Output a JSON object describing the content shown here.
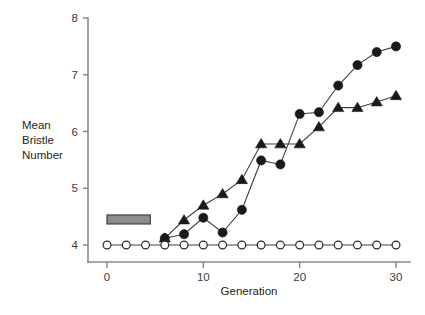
{
  "chart_data": {
    "type": "line",
    "title": "",
    "xlabel": "Generation",
    "ylabel": "Mean Bristle Number",
    "ylabel_lines": [
      "Mean",
      "Bristle",
      "Number"
    ],
    "xlim": [
      0,
      30
    ],
    "ylim": [
      4,
      8
    ],
    "xticks": [
      0,
      10,
      20,
      30
    ],
    "yticks": [
      4,
      5,
      6,
      7,
      8
    ],
    "xtick_labels": [
      "0",
      "10",
      "20",
      "30"
    ],
    "ytick_labels": [
      "4",
      "5",
      "6",
      "7",
      "8"
    ],
    "grid": false,
    "legend": "none",
    "x": [
      0,
      2,
      4,
      6,
      8,
      10,
      12,
      14,
      16,
      18,
      20,
      22,
      24,
      26,
      28,
      30
    ],
    "series": [
      {
        "name": "filled-circle-line",
        "marker": "filled-circle",
        "values": [
          null,
          null,
          null,
          4.12,
          4.19,
          4.48,
          4.22,
          4.62,
          5.49,
          5.42,
          6.31,
          6.34,
          6.81,
          7.17,
          7.4,
          7.5
        ]
      },
      {
        "name": "filled-triangle-line",
        "marker": "filled-triangle",
        "values": [
          null,
          null,
          null,
          4.12,
          4.44,
          4.7,
          4.9,
          5.15,
          5.78,
          5.78,
          5.78,
          6.08,
          6.42,
          6.42,
          6.52,
          6.63
        ]
      },
      {
        "name": "open-circle-control-line",
        "marker": "open-circle",
        "values": [
          4.0,
          4.0,
          4.0,
          4.0,
          4.0,
          4.0,
          4.0,
          4.0,
          4.0,
          4.0,
          4.0,
          4.0,
          4.0,
          4.0,
          4.0,
          4.0
        ]
      }
    ],
    "annotations": [
      {
        "name": "selection-bar",
        "shape": "rectangle",
        "x_start": 0,
        "x_end": 4.5,
        "y_center": 4.45,
        "fill": "#8c8c8c",
        "stroke": "#404040"
      }
    ],
    "colors": {
      "background": "#ffffff",
      "axis": "#8a8a8a",
      "line": "#3f3f3f",
      "marker_filled": "#1a1a1a",
      "marker_open_fill": "#ffffff",
      "marker_open_stroke": "#2b2b2b",
      "text": "#231f20"
    }
  },
  "geometry": {
    "plot_left": 88,
    "plot_right": 410,
    "plot_top": 18,
    "plot_bottom": 245,
    "x_zero_px": 107,
    "x_thirty_px": 396
  }
}
